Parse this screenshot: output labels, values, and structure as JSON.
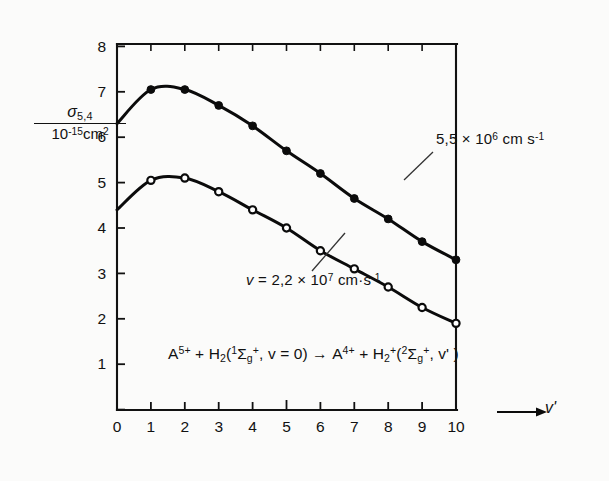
{
  "figure": {
    "background_color": "#fbfbfa",
    "ink_color": "#0b0b0b"
  },
  "axes": {
    "y_label_numerator": "σ",
    "y_label_numerator_sub": "5,4",
    "y_label_denominator_base": "10",
    "y_label_denominator_exp": "-15",
    "y_label_denominator_unit": "cm",
    "y_label_denominator_unit_exp": "2",
    "y_ticks": [
      "1",
      "2",
      "3",
      "4",
      "5",
      "6",
      "7",
      "8"
    ],
    "x_ticks": [
      "0",
      "1",
      "2",
      "3",
      "4",
      "5",
      "6",
      "7",
      "8",
      "9",
      "10"
    ],
    "x_axis_title": "v'",
    "x_axis_arrow": "→"
  },
  "annotations": {
    "upper_curve_label_mantissa": "5,5 × 10",
    "upper_curve_label_exp": "6",
    "upper_curve_label_unit": "cm s",
    "upper_curve_label_unit_exp": "-1",
    "lower_curve_label_prefix": "v",
    "lower_curve_label_mantissa": " = 2,2 × 10",
    "lower_curve_label_exp": "7",
    "lower_curve_label_unit": "cm·s",
    "lower_curve_label_unit_exp": "-1",
    "reaction": {
      "reactant_ion": "A",
      "reactant_ion_charge": "5+",
      "plus_1": " + H",
      "h2_sub": "2",
      "open_paren": "(",
      "state1_pre_sup": "1",
      "sigma": "Σ",
      "state1_sub": "g",
      "state1_sup": "+",
      "vib": ", v = 0)",
      "arrow": "→",
      "product_ion": "A",
      "product_ion_charge": "4+",
      "plus_2": " + H",
      "h2p_sub": "2",
      "h2p_sup": "+",
      "open_paren_2": "(",
      "state2_pre_sup": "2",
      "state2_sub": "g",
      "state2_sup": "+",
      "vib2": ", v' )"
    }
  },
  "chart_data": {
    "type": "line",
    "title": "",
    "xlabel": "v'",
    "ylabel": "σ(5,4) / 10^-15 cm^2",
    "xlim": [
      0,
      10
    ],
    "ylim": [
      0,
      8
    ],
    "grid": false,
    "legend": "inline-annotations",
    "x": [
      0,
      1,
      2,
      3,
      4,
      5,
      6,
      7,
      8,
      9,
      10
    ],
    "series": [
      {
        "name": "5,5 × 10^6 cm s^-1",
        "marker": "filled-circle",
        "values": [
          6.3,
          7.05,
          7.05,
          6.7,
          6.25,
          5.7,
          5.2,
          4.65,
          4.2,
          3.7,
          3.3
        ]
      },
      {
        "name": "v = 2,2 × 10^7 cm·s^-1",
        "marker": "open-circle",
        "values": [
          4.4,
          5.05,
          5.1,
          4.8,
          4.4,
          4.0,
          3.5,
          3.1,
          2.7,
          2.25,
          1.9
        ]
      }
    ]
  }
}
